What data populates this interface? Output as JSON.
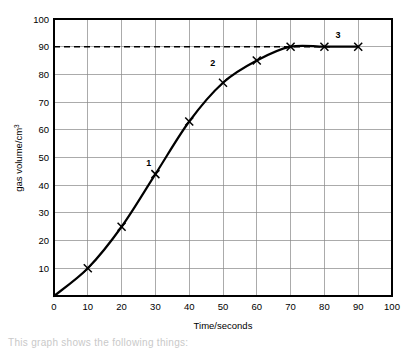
{
  "chart_data": {
    "type": "line",
    "title": "",
    "xlabel": "Time/seconds",
    "ylabel": "gas volume/cm",
    "ylabel_superscript": "3",
    "xlim": [
      0,
      100
    ],
    "ylim": [
      0,
      100
    ],
    "xticks": [
      0,
      10,
      20,
      30,
      40,
      50,
      60,
      70,
      80,
      90,
      100
    ],
    "yticks": [
      0,
      10,
      20,
      30,
      40,
      50,
      60,
      70,
      80,
      90,
      100
    ],
    "xtick_labels": [
      "0",
      "10",
      "20",
      "30",
      "40",
      "50",
      "60",
      "70",
      "80",
      "90",
      "100"
    ],
    "ytick_labels": [
      "0",
      "10",
      "20",
      "30",
      "40",
      "50",
      "60",
      "70",
      "80",
      "90",
      "100"
    ],
    "grid": true,
    "legend": false,
    "series": [
      {
        "name": "gas volume",
        "marker": "x",
        "x": [
          10,
          20,
          30,
          40,
          50,
          60,
          70,
          80,
          90
        ],
        "y": [
          10,
          25,
          44,
          63,
          77,
          85,
          90,
          90,
          90
        ]
      }
    ],
    "reference_lines": [
      {
        "name": "plateau-level",
        "orientation": "horizontal",
        "value": 90,
        "style": "dashed"
      }
    ],
    "annotations": [
      {
        "label": "1",
        "x": 28,
        "y": 47
      },
      {
        "label": "2",
        "x": 47,
        "y": 83
      },
      {
        "label": "3",
        "x": 84,
        "y": 93
      }
    ]
  },
  "footer": {
    "partial_text": "This graph shows the following things:"
  }
}
